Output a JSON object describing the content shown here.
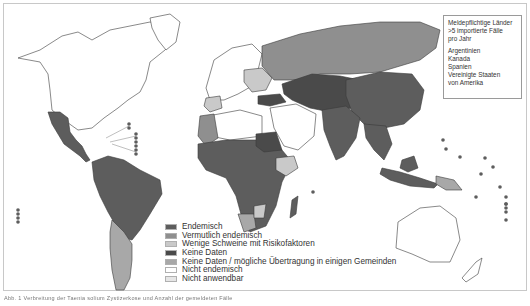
{
  "map": {
    "title": "Taenia solium endemicity world map",
    "colors": {
      "endemic": "#5d5d5d",
      "suspected_endemic": "#8f8f8f",
      "few_pigs_risk": "#c9c9c9",
      "no_data": "#4a4a4a",
      "no_data_possible": "#a8a8a8",
      "not_endemic": "#ffffff",
      "not_applicable": "#e6e6e6",
      "outline": "#3a3a3a",
      "frame": "#c8c8c8"
    }
  },
  "infobox": {
    "title_lines": [
      "Meldepflichtige Länder",
      ">5 importierte Fälle",
      "pro Jahr"
    ],
    "countries": [
      "Argentinien",
      "Kanada",
      "Spanien",
      "Vereinigte Staaten",
      "von Amerika"
    ]
  },
  "legend": {
    "items": [
      {
        "label": "Endemisch",
        "color": "#5d5d5d"
      },
      {
        "label": "Vermutlich endemisch",
        "color": "#8f8f8f"
      },
      {
        "label": "Wenige Schweine mit Risikofaktoren",
        "color": "#c9c9c9"
      },
      {
        "label": "Keine Daten",
        "color": "#4a4a4a"
      },
      {
        "label": "Keine Daten / mögliche Übertragung in einigen Gemeinden",
        "color": "#a8a8a8"
      },
      {
        "label": "Nicht endemisch",
        "color": "#ffffff"
      },
      {
        "label": "Nicht anwendbar",
        "color": "#e6e6e6"
      }
    ]
  },
  "caption": {
    "text": "Abb. 1 Verbreitung der Taenia solium Zystizerkose und Anzahl der gemeldeten Fälle"
  }
}
